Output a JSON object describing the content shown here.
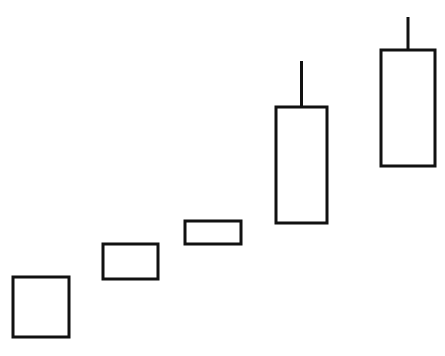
{
  "chart_data": {
    "type": "candlestick",
    "title": "",
    "xlabel": "",
    "ylabel": "",
    "grid": false,
    "legend": null,
    "units": "arbitrary (no axis shown; values estimated from pixel positions, higher = up)",
    "ylim": [
      0,
      356
    ],
    "categories": [
      "1",
      "2",
      "3",
      "4",
      "5"
    ],
    "candles": [
      {
        "index": 1,
        "open": 19,
        "close": 79,
        "high": 79,
        "low": 19,
        "direction": "up",
        "x_left": 13,
        "x_right": 69
      },
      {
        "index": 2,
        "open": 77,
        "close": 112,
        "high": 112,
        "low": 77,
        "direction": "up",
        "x_left": 103,
        "x_right": 158
      },
      {
        "index": 3,
        "open": 112,
        "close": 135,
        "high": 135,
        "low": 112,
        "direction": "up",
        "x_left": 185,
        "x_right": 241
      },
      {
        "index": 4,
        "open": 133,
        "close": 249,
        "high": 295,
        "low": 133,
        "direction": "up",
        "x_left": 276,
        "x_right": 327
      },
      {
        "index": 5,
        "open": 190,
        "close": 306,
        "high": 339,
        "low": 190,
        "direction": "up",
        "x_left": 381,
        "x_right": 435
      }
    ],
    "style": {
      "body_fill": "#ffffff",
      "stroke": "#111111",
      "background": "#ffffff"
    }
  }
}
